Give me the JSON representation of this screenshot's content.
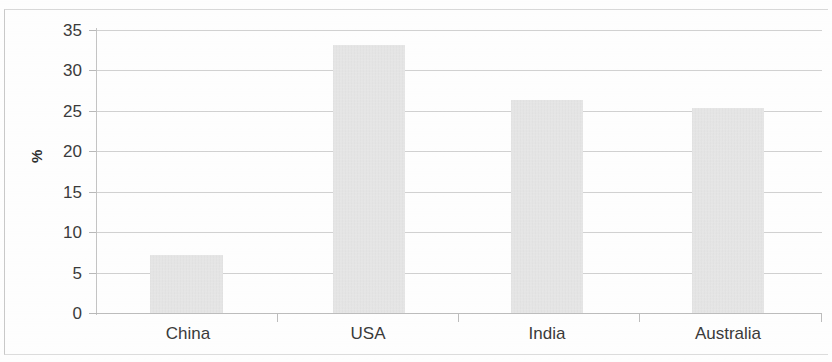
{
  "chart_data": {
    "type": "bar",
    "title": "",
    "subtitle": "",
    "xlabel": "",
    "ylabel": "%",
    "categories": [
      "China",
      "USA",
      "India",
      "Australia"
    ],
    "values": [
      7.2,
      33.2,
      26.4,
      25.4
    ],
    "series": [
      {
        "name": "%",
        "values": [
          7.2,
          33.2,
          26.4,
          25.4
        ]
      }
    ],
    "ylim": [
      0,
      35
    ],
    "yticks": [
      0,
      5,
      10,
      15,
      20,
      25,
      30,
      35
    ],
    "ytick_labels": [
      "0",
      "5",
      "10",
      "15",
      "20",
      "25",
      "30",
      "35"
    ],
    "xtick_labels": [
      "China",
      "USA",
      "India",
      "Australia"
    ],
    "grid": "horizontal",
    "legend": "none",
    "annotations": [],
    "bar_color": "#dddddd",
    "gridline_color": "#c2c2c2",
    "axis_color": "#c4c4c4",
    "text_color": "#3a3a3a"
  },
  "axis": {
    "y_title": "%",
    "ticks": [
      {
        "label": "35",
        "value": 35
      },
      {
        "label": "30",
        "value": 30
      },
      {
        "label": "25",
        "value": 25
      },
      {
        "label": "20",
        "value": 20
      },
      {
        "label": "15",
        "value": 15
      },
      {
        "label": "10",
        "value": 10
      },
      {
        "label": "5",
        "value": 5
      },
      {
        "label": "0",
        "value": 0
      }
    ]
  },
  "bars": [
    {
      "label": "China",
      "value": 7.2
    },
    {
      "label": "USA",
      "value": 33.2
    },
    {
      "label": "India",
      "value": 26.4
    },
    {
      "label": "Australia",
      "value": 25.4
    }
  ]
}
